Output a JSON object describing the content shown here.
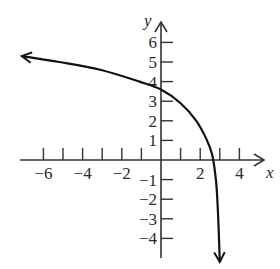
{
  "chart_data": {
    "type": "line",
    "title": "",
    "xlabel": "x",
    "ylabel": "y",
    "xlim": [
      -7.2,
      5.2
    ],
    "ylim": [
      -5.2,
      7.0
    ],
    "grid": false,
    "legend": null,
    "x_ticks": [
      -6,
      -5,
      -4,
      -3,
      -2,
      -1,
      1,
      2,
      3,
      4
    ],
    "x_tick_labels": [
      {
        "value": -6,
        "label": "−6"
      },
      {
        "value": -4,
        "label": "−4"
      },
      {
        "value": -2,
        "label": "−2"
      },
      {
        "value": 2,
        "label": "2"
      },
      {
        "value": 4,
        "label": "4"
      }
    ],
    "y_ticks": [
      -4,
      -3,
      -2,
      -1,
      1,
      2,
      3,
      4,
      5,
      6
    ],
    "y_tick_labels": [
      {
        "value": 6,
        "label": "6"
      },
      {
        "value": 5,
        "label": "5"
      },
      {
        "value": 4,
        "label": "4"
      },
      {
        "value": 3,
        "label": "3"
      },
      {
        "value": 2,
        "label": "2"
      },
      {
        "value": 1,
        "label": "1"
      },
      {
        "value": -1,
        "label": "−1"
      },
      {
        "value": -2,
        "label": "−2"
      },
      {
        "value": -3,
        "label": "−3"
      },
      {
        "value": -4,
        "label": "−4"
      }
    ],
    "series": [
      {
        "name": "curve",
        "description": "Decreasing logarithmic-type curve with vertical asymptote near x = 3; arrows at both ends",
        "x": [
          -7.1,
          -5.2,
          -3.1,
          -1.1,
          0,
          1,
          1.8,
          2.3,
          2.6,
          2.8,
          2.9,
          3.0
        ],
        "y": [
          5.3,
          5.0,
          4.6,
          4.0,
          3.6,
          2.9,
          2.0,
          1.1,
          0.3,
          -1.0,
          -2.5,
          -5.2
        ]
      }
    ],
    "key_points": {
      "y_intercept": 3.6,
      "x_intercept": 2.75,
      "vertical_asymptote_x": 3
    }
  },
  "labels": {
    "x_axis": "x",
    "y_axis": "y"
  }
}
